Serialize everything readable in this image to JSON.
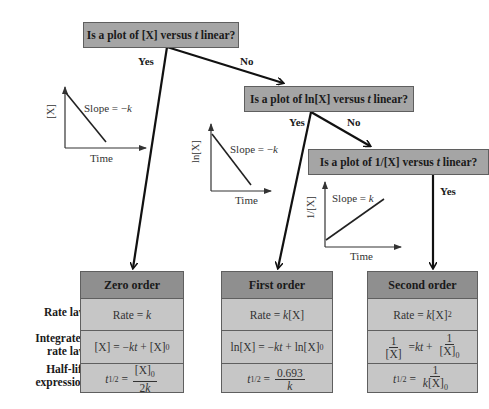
{
  "questions": [
    {
      "id": "q1",
      "text": "Is a plot of [X] versus t linear?"
    },
    {
      "id": "q2",
      "text": "Is a plot of ln[X] versus t linear?"
    },
    {
      "id": "q3",
      "text": "Is a plot of 1/[X] versus t linear?"
    }
  ],
  "branches": {
    "q1_yes": "Yes",
    "q1_no": "No",
    "q2_yes": "Yes",
    "q2_no": "No",
    "q3_yes": "Yes"
  },
  "plots": [
    {
      "ylabel": "[X]",
      "xlabel": "Time",
      "slope_label": "Slope = −k"
    },
    {
      "ylabel": "ln[X]",
      "xlabel": "Time",
      "slope_label": "Slope = −k"
    },
    {
      "ylabel": "1/[X]",
      "xlabel": "Time",
      "slope_label": "Slope = k"
    }
  ],
  "row_labels": {
    "rate_law": "Rate law",
    "integrated_1": "Integrated",
    "integrated_2": "rate law",
    "halflife_1": "Half-life",
    "halflife_2": "expression"
  },
  "orders": [
    {
      "title": "Zero order",
      "rate_law": "Rate = k",
      "integrated": "[X] = −kt + [X]₀",
      "half_life": "t₁/₂ = [X]₀ / 2k"
    },
    {
      "title": "First order",
      "rate_law": "Rate = k[X]",
      "integrated": "ln[X] = −kt + ln[X]₀",
      "half_life": "t₁/₂ = 0.693 / k"
    },
    {
      "title": "Second order",
      "rate_law": "Rate = k[X]²",
      "integrated": "1/[X] = kt + 1/[X]₀",
      "half_life": "t₁/₂ = 1 / k[X]₀"
    }
  ],
  "colors": {
    "question_fill": "#a5a5a5",
    "header_fill": "#8f8f8f",
    "cell_fill": "#c6c6c6",
    "border": "#5f5f5f"
  }
}
